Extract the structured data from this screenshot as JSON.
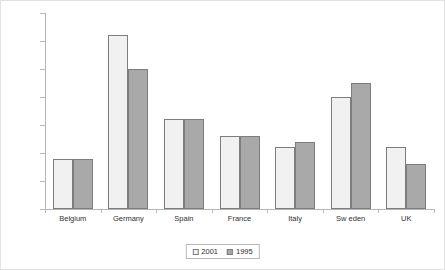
{
  "chart_data": {
    "type": "bar",
    "title": "",
    "subtitle": "",
    "xlabel": "",
    "ylabel": "",
    "categories": [
      "Belgium",
      "Germany",
      "Spain",
      "France",
      "Italy",
      "Sw eden",
      "UK"
    ],
    "series": [
      {
        "name": "2001",
        "color": "#f1f1f1",
        "values": [
          0.9,
          3.1,
          1.6,
          1.3,
          1.1,
          2.0,
          1.1
        ]
      },
      {
        "name": "1995",
        "color": "#a9a9a9",
        "values": [
          0.9,
          2.5,
          1.6,
          1.3,
          1.2,
          2.25,
          0.8
        ]
      }
    ],
    "ylim": [
      0,
      3.5
    ],
    "ytick_values": [
      0,
      0.5,
      1,
      1.5,
      2,
      2.5,
      3,
      3.5
    ],
    "ytick_labels": [
      "0",
      "0,5",
      "1",
      "1,5",
      "2",
      "2,5",
      "3",
      "3,5"
    ],
    "grid": false,
    "legend_position": "bottom",
    "legend_entries": [
      "2001",
      "1995"
    ],
    "decimal_separator": ","
  }
}
